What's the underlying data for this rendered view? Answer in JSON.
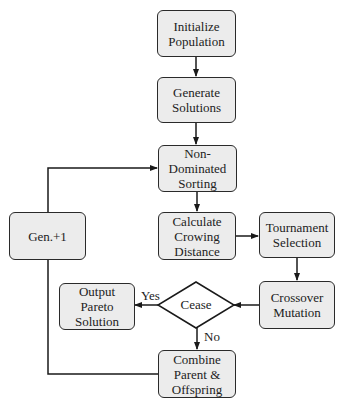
{
  "nodes": {
    "init": "Initialize\nPopulation",
    "generate": "Generate\nSolutions",
    "sorting": "Non-\nDominated\nSorting",
    "crowding": "Calculate\nCrowing\nDistance",
    "tournament": "Tournament\nSelection",
    "crossover": "Crossover\nMutation",
    "cease": "Cease",
    "output": "Output\nPareto\nSolution",
    "combine": "Combine\nParent &\nOffspring",
    "gen": "Gen.+1"
  },
  "edge_labels": {
    "yes": "Yes",
    "no": "No"
  },
  "colors": {
    "box_fill": "#ececec",
    "stroke": "#2a2a2a",
    "diamond_fill": "#ffffff"
  }
}
